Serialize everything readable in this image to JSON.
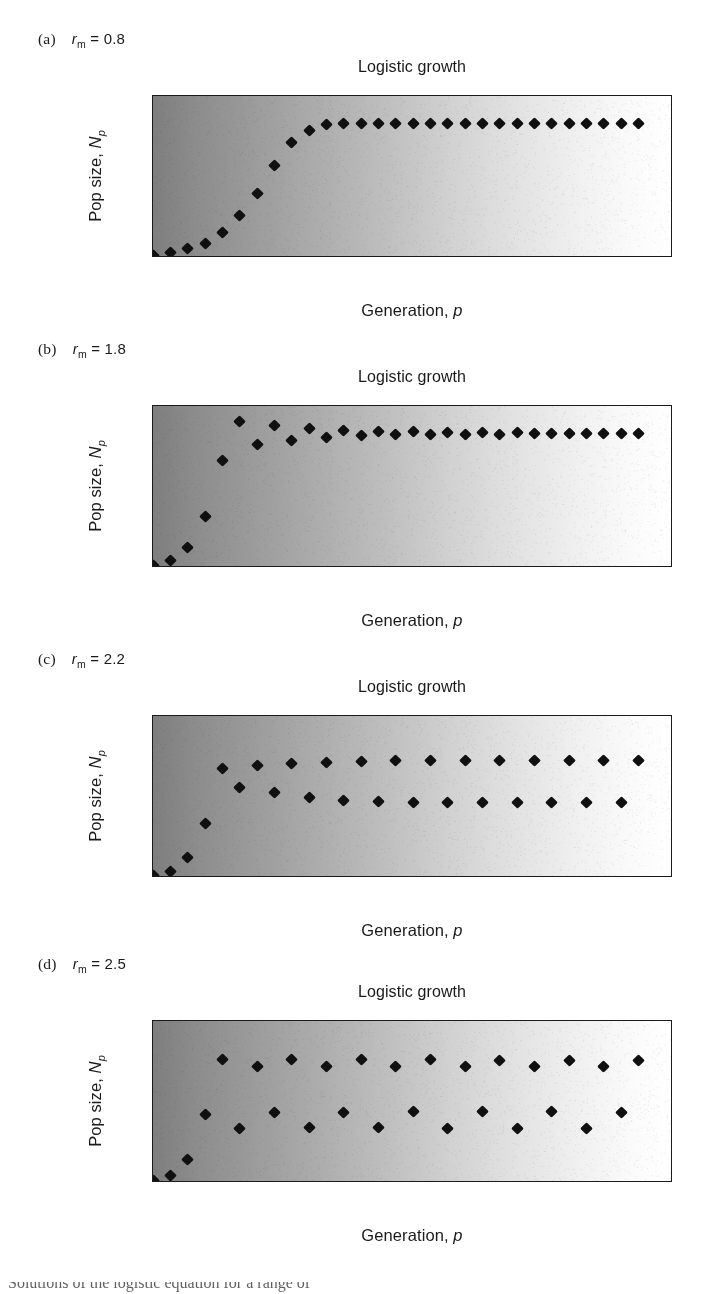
{
  "figure": {
    "background": "#ffffff",
    "marker_color": "#101010",
    "frame_color": "#1b1b1b",
    "gradient_left": "#7e7e7e",
    "gradient_right": "#ffffff",
    "caption_partial": "Solutions of the logistic equation for a range of "
  },
  "shared": {
    "title": "Logistic growth",
    "xlabel_text": "Generation, ",
    "xlabel_italic": "p",
    "ylabel_text": "Pop size, ",
    "ylabel_italic": "N",
    "ylabel_sub": "p",
    "param_italic": "r",
    "param_sub": "m",
    "param_eq": " = "
  },
  "panels": [
    {
      "tag": "(a)",
      "param_value": "0.8",
      "title": "Logistic growth",
      "chart_data": {
        "type": "scatter",
        "title": "Logistic growth",
        "xlabel": "Generation, p",
        "ylabel": "Pop size, Np",
        "xlim": [
          0,
          30
        ],
        "ylim": [
          0,
          60
        ],
        "xticks": [
          0,
          10,
          20,
          30
        ],
        "yticks": [
          0,
          10,
          20,
          30,
          40,
          50,
          60
        ],
        "grid": false,
        "legend": null,
        "series_name": "rm = 0.8",
        "x": [
          0,
          1,
          2,
          3,
          4,
          5,
          6,
          7,
          8,
          9,
          10,
          11,
          12,
          13,
          14,
          15,
          16,
          17,
          18,
          19,
          20,
          21,
          22,
          23,
          24,
          25,
          26,
          27,
          28
        ],
        "values": [
          1.0,
          2.0,
          3.5,
          5.5,
          9.5,
          15.8,
          24.0,
          34.3,
          42.8,
          47.3,
          49.4,
          49.9,
          50.0,
          50.0,
          50.0,
          50.0,
          50.0,
          50.0,
          50.0,
          50.0,
          50.0,
          50.0,
          50.0,
          50.0,
          50.0,
          50.0,
          50.0,
          50.0,
          50.0
        ]
      }
    },
    {
      "tag": "(b)",
      "param_value": "1.8",
      "title": "Logistic growth",
      "chart_data": {
        "type": "scatter",
        "title": "Logistic growth",
        "xlabel": "Generation, p",
        "ylabel": "Pop size, Np",
        "xlim": [
          0,
          30
        ],
        "ylim": [
          0,
          60
        ],
        "xticks": [
          0,
          10,
          20,
          30
        ],
        "yticks": [
          0,
          10,
          20,
          30,
          40,
          50,
          60
        ],
        "grid": false,
        "legend": null,
        "series_name": "rm = 1.8",
        "x": [
          0,
          1,
          2,
          3,
          4,
          5,
          6,
          7,
          8,
          9,
          10,
          11,
          12,
          13,
          14,
          15,
          16,
          17,
          18,
          19,
          20,
          21,
          22,
          23,
          24,
          25,
          26,
          27,
          28
        ],
        "values": [
          1.0,
          2.8,
          7.5,
          19.0,
          40.0,
          54.4,
          45.7,
          52.8,
          47.4,
          51.6,
          48.4,
          51.0,
          48.9,
          50.7,
          49.3,
          50.5,
          49.4,
          50.2,
          49.6,
          50.2,
          49.6,
          50.1,
          49.7,
          50.0,
          49.7,
          50.0,
          49.8,
          50.0,
          49.8
        ]
      }
    },
    {
      "tag": "(c)",
      "param_value": "2.2",
      "title": "Logistic growth",
      "chart_data": {
        "type": "scatter",
        "title": "Logistic growth",
        "xlabel": "Generation, p",
        "ylabel": "Pop size, Np",
        "xlim": [
          0,
          30
        ],
        "ylim": [
          0,
          80
        ],
        "xticks": [
          0,
          10,
          20,
          30
        ],
        "yticks": [
          0,
          20,
          40,
          60,
          80
        ],
        "grid": false,
        "legend": null,
        "series_name": "rm = 2.2",
        "x": [
          0,
          1,
          2,
          3,
          4,
          5,
          6,
          7,
          8,
          9,
          10,
          11,
          12,
          13,
          14,
          15,
          16,
          17,
          18,
          19,
          20,
          21,
          22,
          23,
          24,
          25,
          26,
          27,
          28
        ],
        "values": [
          1.0,
          3.0,
          10.0,
          27.0,
          54.0,
          44.5,
          55.6,
          42.2,
          56.6,
          40.0,
          57.2,
          38.4,
          57.6,
          37.8,
          57.8,
          37.5,
          57.8,
          37.4,
          57.9,
          37.4,
          57.9,
          37.3,
          57.9,
          37.3,
          57.9,
          37.3,
          57.9,
          37.3,
          57.9
        ]
      }
    },
    {
      "tag": "(d)",
      "param_value": "2.5",
      "title": "Logistic growth",
      "chart_data": {
        "type": "scatter",
        "title": "Logistic growth",
        "xlabel": "Generation, p",
        "ylabel": "Pop size, Np",
        "xlim": [
          0,
          30
        ],
        "ylim": [
          0,
          80
        ],
        "xticks": [
          0,
          10,
          20,
          30
        ],
        "yticks": [
          0,
          20,
          40,
          60,
          80
        ],
        "grid": false,
        "legend": null,
        "series_name": "rm = 2.5",
        "x": [
          0,
          1,
          2,
          3,
          4,
          5,
          6,
          7,
          8,
          9,
          10,
          11,
          12,
          13,
          14,
          15,
          16,
          17,
          18,
          19,
          20,
          21,
          22,
          23,
          24,
          25,
          26,
          27,
          28
        ],
        "values": [
          1.0,
          3.5,
          11.8,
          34.0,
          61.0,
          27.0,
          57.6,
          34.8,
          60.8,
          27.3,
          57.6,
          34.8,
          60.8,
          27.3,
          57.6,
          35.3,
          60.8,
          27.0,
          57.3,
          35.3,
          60.6,
          27.0,
          57.3,
          35.3,
          60.6,
          27.0,
          57.3,
          35.0,
          60.6
        ]
      }
    }
  ]
}
